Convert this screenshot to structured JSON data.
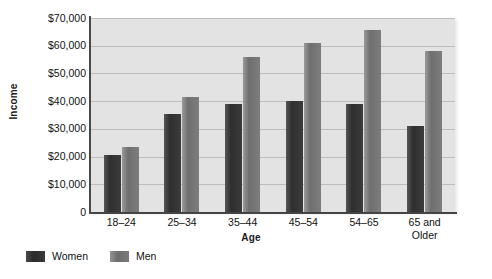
{
  "chart_data": {
    "type": "bar",
    "title": "",
    "xlabel": "Age",
    "ylabel": "Income",
    "categories": [
      "18–24",
      "25–34",
      "35–44",
      "45–54",
      "54–65",
      "65 and\nOlder"
    ],
    "series": [
      {
        "name": "Women",
        "color": "#3a3a3a",
        "values": [
          20500,
          35500,
          39000,
          40000,
          39000,
          31000
        ]
      },
      {
        "name": "Men",
        "color": "#7d7d7d",
        "values": [
          23500,
          41500,
          56000,
          61000,
          65500,
          58000
        ]
      }
    ],
    "ylim": [
      0,
      70000
    ],
    "ytick_values": [
      70000,
      60000,
      50000,
      40000,
      30000,
      20000,
      10000,
      0
    ],
    "ytick_labels": [
      "$70,000",
      "$60,000",
      "$50,000",
      "$40,000",
      "$30,000",
      "$20,000",
      "$10,000",
      "0"
    ],
    "grid": true,
    "legend_position": "bottom-left",
    "plot_background": "#e3e3e3",
    "gridline_color": "#bdbdbd",
    "axis_color": "#4a4a4a"
  },
  "legend": {
    "items": [
      {
        "label": "Women",
        "swatch": "women"
      },
      {
        "label": "Men",
        "swatch": "men"
      }
    ]
  }
}
